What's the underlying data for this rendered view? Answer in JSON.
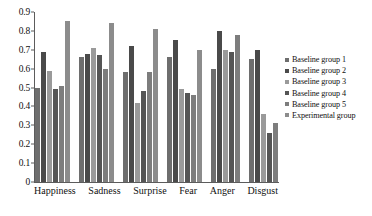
{
  "chart_data": {
    "type": "bar",
    "title": "",
    "xlabel": "",
    "ylabel": "",
    "ylim": [
      0,
      0.9
    ],
    "ytick_values": [
      0,
      0.1,
      0.2,
      0.3,
      0.4,
      0.5,
      0.6,
      0.7,
      0.8,
      0.9
    ],
    "ytick_labels": [
      "0",
      "0.1",
      "0.2",
      "0.3",
      "0.4",
      "0.5",
      "0.6",
      "0.7",
      "0.8",
      "0.9"
    ],
    "grid": false,
    "legend_position": "right",
    "categories": [
      "Happiness",
      "Sadness",
      "Surprise",
      "Fear",
      "Anger",
      "Disgust"
    ],
    "series": [
      {
        "name": "Baseline group 1",
        "color": "#6e6e6e",
        "values": [
          0.5,
          0.66,
          0.58,
          0.66,
          0.6,
          0.65
        ]
      },
      {
        "name": "Baseline group 2",
        "color": "#4a4a4a",
        "values": [
          0.69,
          0.68,
          0.72,
          0.75,
          0.8,
          0.7
        ]
      },
      {
        "name": "Baseline group 3",
        "color": "#9a9a9a",
        "values": [
          0.59,
          0.71,
          0.42,
          0.49,
          0.7,
          0.36
        ]
      },
      {
        "name": "Baseline group 4",
        "color": "#555555",
        "values": [
          0.49,
          0.67,
          0.48,
          0.47,
          0.69,
          0.26
        ]
      },
      {
        "name": "Baseline group 5",
        "color": "#7d7d7d",
        "values": [
          0.51,
          0.6,
          0.58,
          0.46,
          0.78,
          0.31
        ]
      },
      {
        "name": "Experimental group",
        "color": "#8c8c8c",
        "values": [
          0.85,
          0.84,
          0.81,
          0.7,
          0.0,
          0.0
        ]
      }
    ]
  }
}
